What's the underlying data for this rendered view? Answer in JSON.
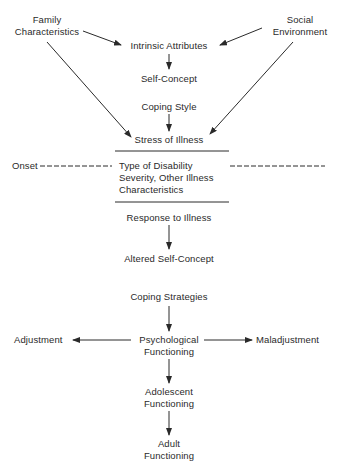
{
  "diagram": {
    "nodes": {
      "family_characteristics": [
        "Family",
        "Characteristics"
      ],
      "social_environment": [
        "Social",
        "Environment"
      ],
      "intrinsic_attributes": "Intrinsic Attributes",
      "self_concept": "Self-Concept",
      "coping_style": "Coping Style",
      "stress_of_illness": "Stress of Illness",
      "onset": "Onset",
      "illness_characteristics": [
        "Type of Disability",
        "Severity, Other Illness",
        "Characteristics"
      ],
      "response_to_illness": "Response to Illness",
      "altered_self_concept": "Altered Self-Concept",
      "coping_strategies": "Coping Strategies",
      "adjustment": "Adjustment",
      "psychological_functioning": [
        "Psychological",
        "Functioning"
      ],
      "maladjustment": "Maladjustment",
      "adolescent_functioning": [
        "Adolescent",
        "Functioning"
      ],
      "adult_functioning": [
        "Adult",
        "Functioning"
      ]
    },
    "edges": [
      {
        "from": "family_characteristics",
        "to": "intrinsic_attributes",
        "style": "arrow"
      },
      {
        "from": "social_environment",
        "to": "intrinsic_attributes",
        "style": "arrow"
      },
      {
        "from": "intrinsic_attributes",
        "to": "self_concept",
        "style": "arrow"
      },
      {
        "from": "coping_style",
        "to": "stress_of_illness",
        "style": "arrow"
      },
      {
        "from": "family_characteristics",
        "to": "stress_of_illness",
        "style": "arrow"
      },
      {
        "from": "social_environment",
        "to": "stress_of_illness",
        "style": "arrow"
      },
      {
        "from": "onset",
        "to": "illness_characteristics",
        "style": "dashed"
      },
      {
        "from": "illness_characteristics",
        "to": "right_edge",
        "style": "dashed"
      },
      {
        "from": "response_to_illness",
        "to": "altered_self_concept",
        "style": "arrow"
      },
      {
        "from": "coping_strategies",
        "to": "psychological_functioning",
        "style": "arrow"
      },
      {
        "from": "psychological_functioning",
        "to": "adjustment",
        "style": "arrow"
      },
      {
        "from": "psychological_functioning",
        "to": "maladjustment",
        "style": "arrow"
      },
      {
        "from": "psychological_functioning",
        "to": "adolescent_functioning",
        "style": "arrow"
      },
      {
        "from": "adolescent_functioning",
        "to": "adult_functioning",
        "style": "arrow"
      }
    ],
    "colors": {
      "ink": "#2a2a2a",
      "background": "#ffffff"
    }
  }
}
